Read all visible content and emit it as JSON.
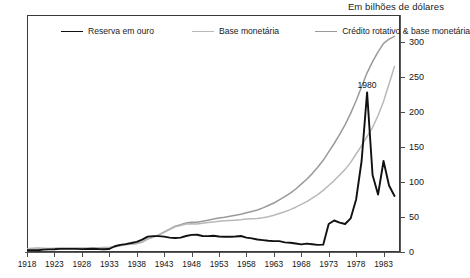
{
  "caption": {
    "units": "Em bilhões de dólares"
  },
  "legend": {
    "position": "top-inside",
    "items": [
      {
        "label": "Reserva em ouro",
        "color": "#111111",
        "width": 1.9
      },
      {
        "label": "Base monetária",
        "color": "#b9b9b9",
        "width": 1.5
      },
      {
        "label": "Crédito rotativo & base monetária",
        "color": "#9a9a9a",
        "width": 1.5
      }
    ]
  },
  "annotations": [
    {
      "text": "1980",
      "x": 1980,
      "y": 228,
      "dy": -12
    }
  ],
  "chart_data": {
    "type": "line",
    "title": "",
    "subtitle": "",
    "xlabel": "",
    "ylabel": "Em bilhões de dólares",
    "xlim": [
      1918,
      1986
    ],
    "ylim": [
      0,
      310
    ],
    "yticks": [
      0,
      50,
      100,
      150,
      200,
      250,
      300
    ],
    "xticks": [
      1918,
      1923,
      1928,
      1933,
      1938,
      1943,
      1948,
      1953,
      1958,
      1963,
      1968,
      1973,
      1978,
      1983
    ],
    "grid": false,
    "legend_position": "top-inside",
    "x": [
      1918,
      1919,
      1920,
      1921,
      1922,
      1923,
      1924,
      1925,
      1926,
      1927,
      1928,
      1929,
      1930,
      1931,
      1932,
      1933,
      1934,
      1935,
      1936,
      1937,
      1938,
      1939,
      1940,
      1941,
      1942,
      1943,
      1944,
      1945,
      1946,
      1947,
      1948,
      1949,
      1950,
      1951,
      1952,
      1953,
      1954,
      1955,
      1956,
      1957,
      1958,
      1959,
      1960,
      1961,
      1962,
      1963,
      1964,
      1965,
      1966,
      1967,
      1968,
      1969,
      1970,
      1971,
      1972,
      1973,
      1974,
      1975,
      1976,
      1977,
      1978,
      1979,
      1980,
      1981,
      1982,
      1983,
      1984,
      1985
    ],
    "series": [
      {
        "name": "Reserva em ouro",
        "color": "#111111",
        "values": [
          2.7,
          2.7,
          2.6,
          3.4,
          3.8,
          4.0,
          4.5,
          4.4,
          4.5,
          4.4,
          4.1,
          4.3,
          4.6,
          4.2,
          4.0,
          4.3,
          8.2,
          10.1,
          11.3,
          12.8,
          14.5,
          17.6,
          22.0,
          22.7,
          22.7,
          21.9,
          20.6,
          20.1,
          20.5,
          22.9,
          24.4,
          24.6,
          22.8,
          22.7,
          23.3,
          22.1,
          21.8,
          21.8,
          22.1,
          22.9,
          20.6,
          19.5,
          17.8,
          16.9,
          16.1,
          15.6,
          15.5,
          13.8,
          13.2,
          12.1,
          10.9,
          11.9,
          11.1,
          10.2,
          10.5,
          11.7,
          11.6,
          11.6,
          11.6,
          11.7,
          11.7,
          11.2,
          11.2,
          11.2,
          11.1,
          11.1,
          11.1,
          11.1
        ],
        "values_display": [
          2.7,
          2.7,
          2.6,
          3.4,
          3.8,
          4.0,
          4.5,
          4.4,
          4.5,
          4.4,
          4.1,
          4.3,
          4.6,
          4.2,
          4.0,
          4.3,
          8.2,
          10.1,
          11.3,
          12.8,
          14.5,
          17.6,
          22.0,
          22.7,
          22.7,
          21.9,
          20.6,
          20.1,
          20.5,
          22.9,
          24.4,
          24.6,
          22.8,
          22.7,
          23.3,
          22.1,
          21.8,
          21.8,
          22.1,
          22.9,
          20.6,
          19.5,
          17.8,
          16.9,
          16.1,
          15.6,
          15.5,
          13.8,
          13.2,
          12.1,
          10.9,
          11.9,
          11.1,
          10.2,
          10.5,
          40.0,
          45.0,
          42.0,
          40.0,
          48.0,
          75.0,
          130.0,
          228.0,
          110.0,
          82.0,
          130.0,
          95.0,
          80.0
        ]
      },
      {
        "name": "Base monetária",
        "color": "#b9b9b9",
        "values": [
          4.5,
          5.0,
          5.3,
          5.0,
          4.8,
          5.0,
          5.2,
          5.3,
          5.3,
          5.3,
          5.2,
          5.3,
          5.4,
          5.6,
          6.2,
          6.4,
          7.5,
          9.0,
          10.5,
          11.5,
          12.0,
          14.0,
          18.5,
          21.0,
          24.0,
          28.0,
          32.0,
          36.0,
          38.0,
          40.0,
          40.5,
          40.0,
          41.0,
          42.0,
          43.0,
          44.0,
          44.5,
          45.0,
          45.5,
          46.0,
          47.0,
          47.5,
          48.0,
          49.0,
          50.5,
          52.5,
          55.0,
          57.5,
          60.5,
          64.0,
          68.0,
          72.0,
          77.0,
          82.0,
          88.0,
          95.0,
          102.0,
          110.0,
          118.0,
          128.0,
          140.0,
          152.0,
          165.0,
          178.0,
          195.0,
          215.0,
          240.0,
          265.0
        ],
        "values_display": null
      },
      {
        "name": "Crédito rotativo & base monetária",
        "color": "#9a9a9a",
        "values": [
          4.6,
          5.1,
          5.4,
          5.1,
          4.9,
          5.1,
          5.3,
          5.4,
          5.4,
          5.4,
          5.3,
          5.4,
          5.5,
          5.7,
          6.3,
          6.5,
          7.6,
          9.1,
          10.6,
          11.6,
          12.2,
          14.2,
          18.8,
          21.4,
          24.5,
          28.6,
          32.7,
          36.8,
          39.0,
          41.5,
          42.5,
          42.5,
          44.0,
          45.5,
          47.0,
          48.5,
          49.5,
          51.0,
          52.5,
          54.0,
          56.0,
          58.0,
          60.0,
          63.0,
          66.5,
          70.0,
          74.5,
          79.0,
          84.0,
          90.0,
          97.0,
          104.0,
          112.0,
          121.0,
          131.0,
          143.0,
          155.0,
          168.0,
          182.0,
          198.0,
          216.0,
          236.0,
          256.0,
          272.0,
          286.0,
          298.0,
          304.0,
          308.0
        ],
        "values_display": null
      }
    ]
  }
}
